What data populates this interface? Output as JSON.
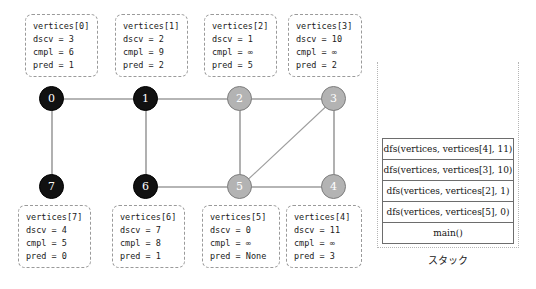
{
  "vertex_boxes_top": [
    {
      "title": "vertices[0]",
      "dscv": "dscv = 3",
      "cmpl": "cmpl = 6",
      "pred": "pred = 1"
    },
    {
      "title": "vertices[1]",
      "dscv": "dscv = 2",
      "cmpl": "cmpl = 9",
      "pred": "pred = 2"
    },
    {
      "title": "vertices[2]",
      "dscv": "dscv = 1",
      "cmpl": "cmpl = ∞",
      "pred": "pred = 5"
    },
    {
      "title": "vertices[3]",
      "dscv": "dscv = 10",
      "cmpl": "cmpl = ∞",
      "pred": "pred = 2"
    }
  ],
  "vertex_boxes_bottom": [
    {
      "title": "vertices[7]",
      "dscv": "dscv = 4",
      "cmpl": "cmpl = 5",
      "pred": "pred = 0"
    },
    {
      "title": "vertices[6]",
      "dscv": "dscv = 7",
      "cmpl": "cmpl = 8",
      "pred": "pred = 1"
    },
    {
      "title": "vertices[5]",
      "dscv": "dscv = 0",
      "cmpl": "cmpl = ∞",
      "pred": "pred = None"
    },
    {
      "title": "vertices[4]",
      "dscv": "dscv = 11",
      "cmpl": "cmpl = ∞",
      "pred": "pred = 3"
    }
  ],
  "graph": {
    "nodes": [
      {
        "label": "0",
        "state": "black",
        "x": 52,
        "y": 99
      },
      {
        "label": "1",
        "state": "black",
        "x": 146,
        "y": 99
      },
      {
        "label": "2",
        "state": "gray",
        "x": 240,
        "y": 99
      },
      {
        "label": "3",
        "state": "gray",
        "x": 334,
        "y": 99
      },
      {
        "label": "7",
        "state": "black",
        "x": 52,
        "y": 187
      },
      {
        "label": "6",
        "state": "black",
        "x": 146,
        "y": 187
      },
      {
        "label": "5",
        "state": "gray",
        "x": 240,
        "y": 187
      },
      {
        "label": "4",
        "state": "gray",
        "x": 334,
        "y": 187
      }
    ],
    "edges": [
      {
        "from": "0",
        "to": "1"
      },
      {
        "from": "1",
        "to": "2"
      },
      {
        "from": "2",
        "to": "3"
      },
      {
        "from": "0",
        "to": "7"
      },
      {
        "from": "1",
        "to": "6"
      },
      {
        "from": "2",
        "to": "5"
      },
      {
        "from": "3",
        "to": "4"
      },
      {
        "from": "3",
        "to": "5"
      },
      {
        "from": "6",
        "to": "5"
      },
      {
        "from": "5",
        "to": "4"
      }
    ],
    "edge_color": "#9d9d9d",
    "black_node_color": "#111111",
    "gray_node_color": "#b3b3b3"
  },
  "stack": {
    "caption": "スタック",
    "frames": [
      "dfs(vertices, vertices[4], 11)",
      "dfs(vertices, vertices[3], 10)",
      "dfs(vertices, vertices[2], 1)",
      "dfs(vertices, vertices[5], 0)",
      "main()"
    ]
  }
}
